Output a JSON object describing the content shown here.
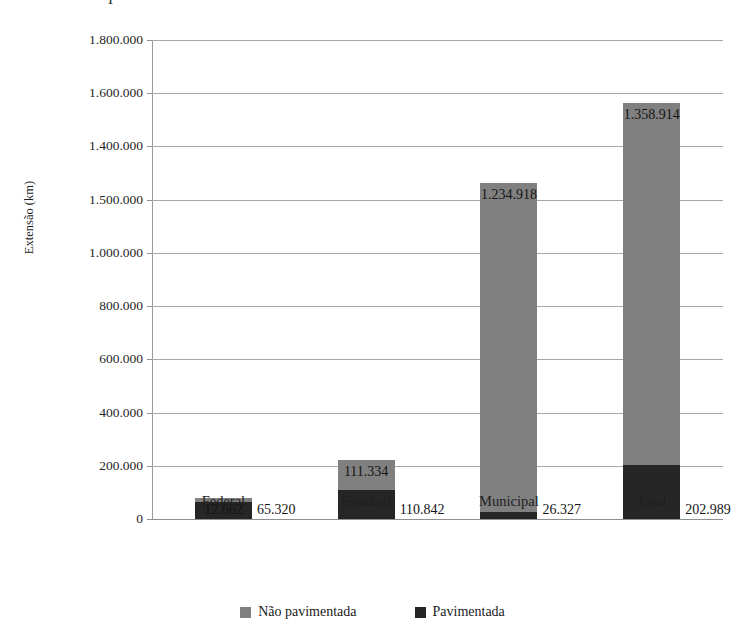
{
  "figure": {
    "title_remnant": "I",
    "background": "#ffffff"
  },
  "chart_data": {
    "type": "bar",
    "stacked": true,
    "orientation": "vertical",
    "title": "",
    "xlabel": "",
    "ylabel": "Extensão (km)",
    "categories": [
      "Federal",
      "Estadual",
      "Municipal",
      "Total"
    ],
    "series": [
      {
        "name": "Pavimentada",
        "color": "#262626",
        "values": [
          65320,
          110842,
          26327,
          202989
        ],
        "value_labels": [
          "65.320",
          "110.842",
          "26.327",
          "202.989"
        ]
      },
      {
        "name": "Não pavimentada",
        "color": "#808080",
        "values": [
          12662,
          111334,
          1234918,
          1358914
        ],
        "value_labels": [
          "12.662",
          "111.334",
          "1.234.918",
          "1.358.914"
        ]
      }
    ],
    "totals": [
      77982,
      222176,
      1261245,
      1561903
    ],
    "ylim": [
      0,
      1800000
    ],
    "ytick_values": [
      0,
      200000,
      400000,
      600000,
      800000,
      1000000,
      1200000,
      1400000,
      1600000,
      1800000
    ],
    "ytick_labels": [
      "0",
      "200.000",
      "400.000",
      "600.000",
      "800.000",
      "1.000.000",
      "1.500.000",
      "1.400.000",
      "1.600.000",
      "1.800.000"
    ],
    "grid": true,
    "grid_axis": "y",
    "legend_position": "bottom",
    "legend_entries": [
      {
        "label": "Não pavimentada",
        "color": "#808080"
      },
      {
        "label": "Pavimentada",
        "color": "#262626"
      }
    ]
  }
}
